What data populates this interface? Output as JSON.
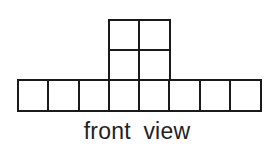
{
  "figure": {
    "caption": "front view",
    "stroke_color": "#1a1a1a",
    "grid": {
      "origin_x": 18,
      "origin_y": 20,
      "cell_width": 30.25,
      "cell_height": 30,
      "columns": 8,
      "rows": 3
    },
    "cells": [
      {
        "col": 3,
        "row": 0
      },
      {
        "col": 4,
        "row": 0
      },
      {
        "col": 3,
        "row": 1
      },
      {
        "col": 4,
        "row": 1
      },
      {
        "col": 0,
        "row": 2
      },
      {
        "col": 1,
        "row": 2
      },
      {
        "col": 2,
        "row": 2
      },
      {
        "col": 3,
        "row": 2
      },
      {
        "col": 4,
        "row": 2
      },
      {
        "col": 5,
        "row": 2
      },
      {
        "col": 6,
        "row": 2
      },
      {
        "col": 7,
        "row": 2
      }
    ]
  }
}
